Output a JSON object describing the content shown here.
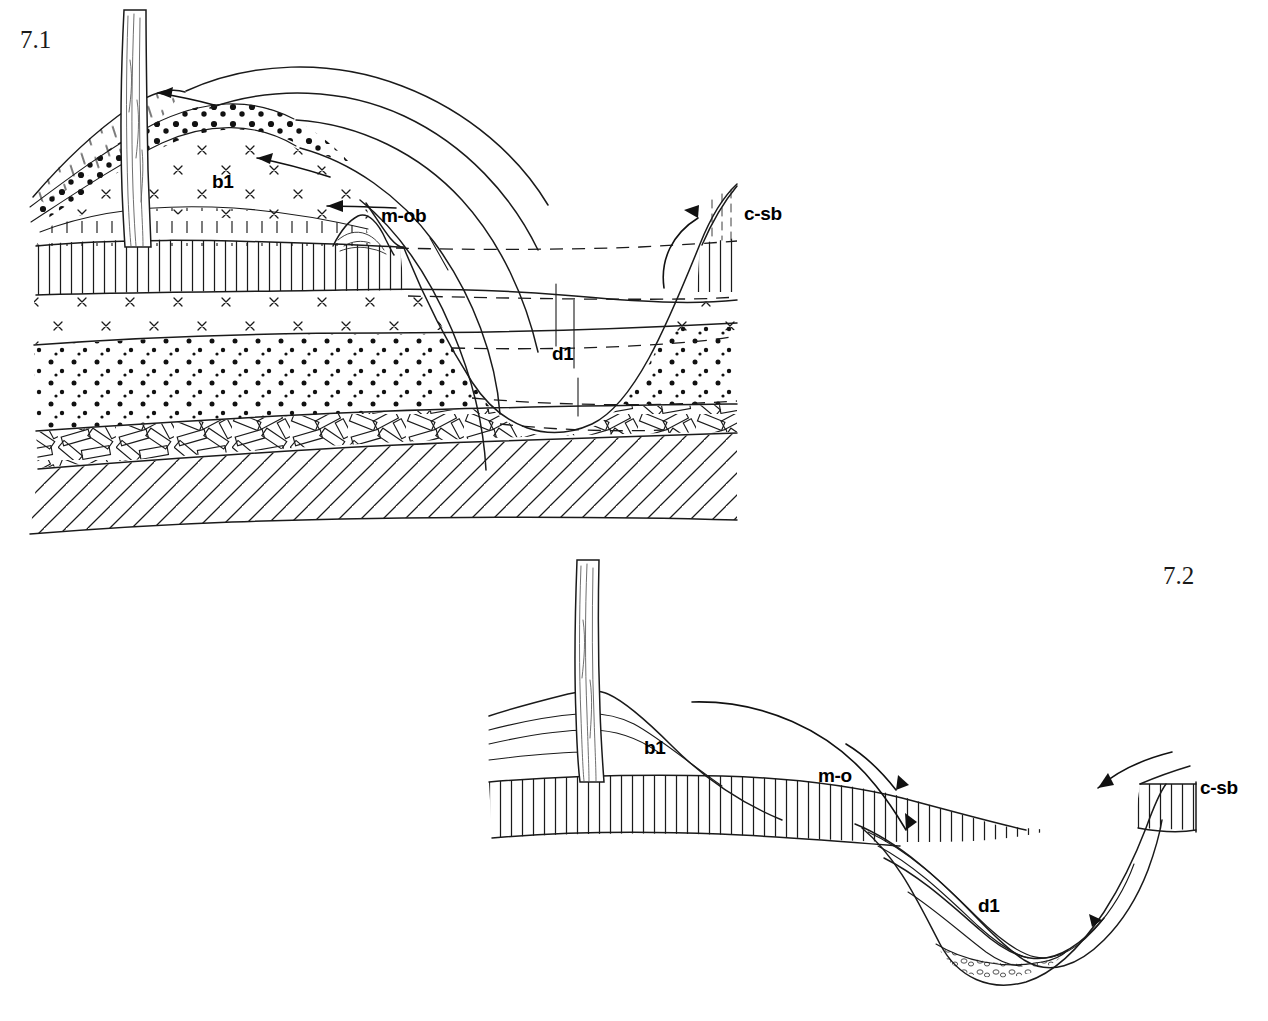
{
  "document": {
    "kind": "geological-cross-section-figure-plate",
    "background_color": "#ffffff",
    "ink_color": "#1a1a1a"
  },
  "figures": [
    {
      "id": "fig-7-1",
      "number": "7.1",
      "number_position": "top-left",
      "labels": [
        {
          "id": "b1",
          "text": "b1",
          "x": 232,
          "y": 188
        },
        {
          "id": "mob",
          "text": "m-ob",
          "x": 381,
          "y": 222
        },
        {
          "id": "csb",
          "text": "c-sb",
          "x": 744,
          "y": 220
        },
        {
          "id": "d1",
          "text": "d1",
          "x": 554,
          "y": 360
        }
      ],
      "units": [
        {
          "name": "talus-hatch-wedge",
          "pattern": "short-dash-hatch"
        },
        {
          "name": "pebble-band",
          "pattern": "coarse-dots"
        },
        {
          "name": "x-mark-mound",
          "pattern": "x-marks"
        },
        {
          "name": "vertical-ruled-bed",
          "pattern": "vertical-ruling"
        },
        {
          "name": "x-mark-bed",
          "pattern": "x-marks"
        },
        {
          "name": "stipple-sand-bed",
          "pattern": "fine-dots"
        },
        {
          "name": "breccia-conglomerate",
          "pattern": "interlocking-bricks"
        },
        {
          "name": "diagonal-hatch-bedrock",
          "pattern": "diagonal-hatch"
        }
      ],
      "features": {
        "tree_trunk": true,
        "incised_valley": true,
        "correlation_dashes": 4,
        "sweeping_arcs": 5,
        "arrows": 4
      }
    },
    {
      "id": "fig-7-2",
      "number": "7.2",
      "number_position": "right",
      "labels": [
        {
          "id": "b1",
          "text": "b1",
          "x": 658,
          "y": 748
        },
        {
          "id": "mo",
          "text": "m-o",
          "x": 838,
          "y": 777
        },
        {
          "id": "csb",
          "text": "c-sb",
          "x": 1202,
          "y": 790
        },
        {
          "id": "d1",
          "text": "d1",
          "x": 992,
          "y": 905
        }
      ],
      "units": [
        {
          "name": "vertical-ruled-bed",
          "pattern": "vertical-ruling"
        },
        {
          "name": "channel-fill-beds",
          "pattern": "blank-laminated"
        },
        {
          "name": "basal-gravel-lens",
          "pattern": "pebble-lens"
        }
      ],
      "features": {
        "tree_trunk": true,
        "channel": true,
        "arrows": 3
      }
    }
  ]
}
